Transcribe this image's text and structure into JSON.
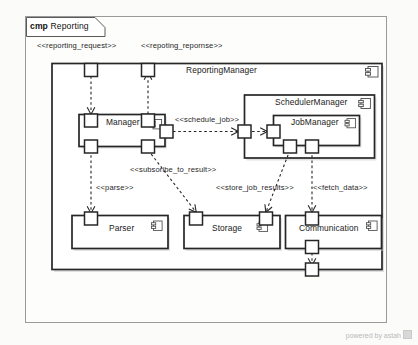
{
  "diagram": {
    "kind_keyword": "cmp",
    "name": "Reporting",
    "frame_label_full": "cmp Reporting"
  },
  "components": {
    "reporting_manager": {
      "name": "ReportingManager",
      "icon": "component-icon"
    },
    "manager": {
      "name": "Manager",
      "icon": "component-icon"
    },
    "scheduler_manager": {
      "name": "SchedulerManager",
      "icon": "component-icon"
    },
    "job_manager": {
      "name": "JobManager",
      "icon": "component-icon"
    },
    "parser": {
      "name": "Parser",
      "icon": "component-icon"
    },
    "storage": {
      "name": "Storage",
      "icon": "component-icon"
    },
    "communication": {
      "name": "Communication",
      "icon": "component-icon"
    }
  },
  "connectors": [
    {
      "id": "reporting_request",
      "label": "<<reporting_request>>"
    },
    {
      "id": "repoting_repornse",
      "label": "<<repoting_repornse>>"
    },
    {
      "id": "schedule_job",
      "label": "<<schedule_job>>"
    },
    {
      "id": "subsoribe_to_result",
      "label": "<<subsoribe_to_result>>"
    },
    {
      "id": "parse",
      "label": "<<parse>>"
    },
    {
      "id": "store_job_results",
      "label": "<<store_job_results>>"
    },
    {
      "id": "fetch_data",
      "label": "<<fetch_data>>"
    }
  ],
  "footer": {
    "text": "powered by astah"
  },
  "colors": {
    "stroke": "#262626",
    "component_fill": "#ffffff",
    "shadow": "#c9c9c9",
    "page_background": "#fbfbfa",
    "frame_stroke": "#9a9a9a",
    "footer_text": "#b9b9b9"
  }
}
